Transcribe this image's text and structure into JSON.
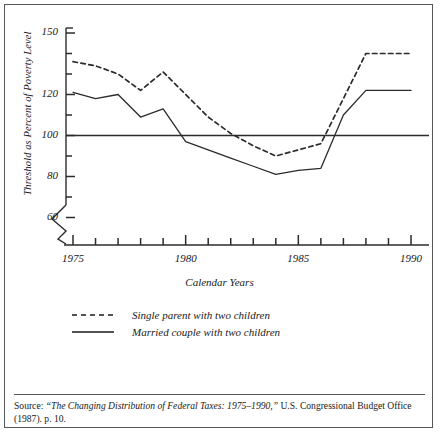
{
  "figure": {
    "ylabel": "Threshold as Percent of Poverty Level",
    "xlabel": "Calendar Years",
    "source_prefix": "Source:",
    "source_title": "“The Changing Distribution of Federal Taxes: 1975–1990,”",
    "source_rest": " U.S. Congressional Budget Office (1987). p. 10."
  },
  "legend": {
    "items": [
      {
        "label": "Single parent with two children",
        "style": "dashed",
        "color": "#1a1a1a",
        "name": "legend-single-parent"
      },
      {
        "label": "Married couple with two children",
        "style": "solid",
        "color": "#1a1a1a",
        "name": "legend-married-couple"
      }
    ]
  },
  "chart_data": {
    "type": "line",
    "title": "",
    "xlabel": "Calendar Years",
    "ylabel": "Threshold as Percent of Poverty Level",
    "x": [
      1975,
      1976,
      1977,
      1978,
      1979,
      1980,
      1981,
      1982,
      1983,
      1984,
      1985,
      1986,
      1987,
      1988,
      1989,
      1990
    ],
    "xlim": [
      1975,
      1990
    ],
    "ylim": [
      60,
      150
    ],
    "xticks": [
      1975,
      1976,
      1977,
      1978,
      1979,
      1980,
      1981,
      1982,
      1983,
      1984,
      1985,
      1986,
      1987,
      1988,
      1989,
      1990
    ],
    "xtick_labels": [
      "1975",
      "",
      "",
      "",
      "",
      "1980",
      "",
      "",
      "",
      "",
      "1985",
      "",
      "",
      "",
      "",
      "1990"
    ],
    "yticks": [
      60,
      70,
      80,
      90,
      100,
      110,
      120,
      130,
      140,
      150
    ],
    "ytick_labels": [
      "60",
      "",
      "80",
      "",
      "100",
      "",
      "120",
      "",
      "",
      "150"
    ],
    "grid": false,
    "reference_line": {
      "value": 100,
      "label": "100 percent of poverty level"
    },
    "axis_break": true,
    "legend_position": "below-plot",
    "series": [
      {
        "name": "Single parent with two children",
        "style": "dashed",
        "values": [
          136,
          134,
          130,
          122,
          131,
          120,
          109,
          101,
          95,
          90,
          93,
          96,
          118,
          140,
          140,
          140
        ]
      },
      {
        "name": "Married couple with two children",
        "style": "solid",
        "values": [
          121,
          118,
          120,
          109,
          113,
          97,
          93,
          89,
          85,
          81,
          83,
          84,
          110,
          122,
          122,
          122
        ]
      }
    ]
  }
}
